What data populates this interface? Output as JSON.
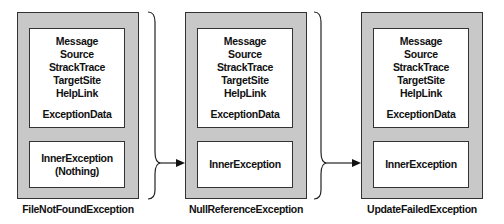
{
  "diagram": {
    "type": "exception-chain",
    "fields": [
      "Message",
      "Source",
      "StrackTrace",
      "TargetSite",
      "HelpLink"
    ],
    "extra_field": "ExceptionData",
    "exceptions": [
      {
        "name": "FileNotFoundException",
        "inner_label": "InnerException",
        "inner_value": "(Nothing)"
      },
      {
        "name": "NullReferenceException",
        "inner_label": "InnerException",
        "inner_value": ""
      },
      {
        "name": "UpdateFailedException",
        "inner_label": "InnerException",
        "inner_value": ""
      }
    ],
    "colors": {
      "outer_fill": "#c8c8c8",
      "stroke": "#333333",
      "inner_fill": "#ffffff"
    }
  }
}
